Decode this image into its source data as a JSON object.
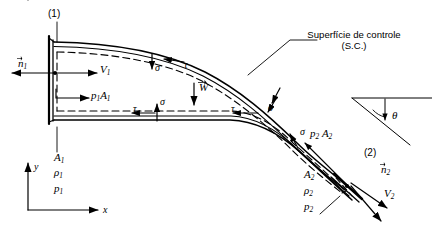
{
  "figure": {
    "kind": "fluid-mechanics-control-volume-diagram",
    "colors": {
      "stroke": "#000000",
      "background": "#ffffff",
      "dashed_control_surface": "#000000"
    }
  },
  "annotations": {
    "control_surface_line1": "Superfície de controle",
    "control_surface_line2": "(S.C.)",
    "section_1": "(1)",
    "section_2": "(2)",
    "normal_1": "n",
    "normal_1_sub": "1",
    "normal_2": "n",
    "normal_2_sub": "2",
    "velocity_1": "V",
    "velocity_1_sub": "1",
    "velocity_2": "V",
    "velocity_2_sub": "2",
    "force_1": "p",
    "force_1_sub": "1",
    "force_1_area": "A",
    "force_1_area_sub": "1",
    "force_2": "p",
    "force_2_sub": "2",
    "force_2_area": "A",
    "force_2_area_sub": "2",
    "weight": "W",
    "theta": "θ",
    "axis_x": "x",
    "axis_y": "y"
  },
  "stresses": {
    "sigma": "σ",
    "tau": "τ",
    "sigma_labels": [
      "σ",
      "σ",
      "σ",
      "σ"
    ],
    "tau_labels": [
      "τ",
      "τ",
      "τ",
      "τ"
    ]
  },
  "inlet_properties": [
    {
      "symbol": "A",
      "sub": "1"
    },
    {
      "symbol": "ρ",
      "sub": "1"
    },
    {
      "symbol": "p",
      "sub": "1"
    }
  ],
  "outlet_properties": [
    {
      "symbol": "A",
      "sub": "2"
    },
    {
      "symbol": "ρ",
      "sub": "2"
    },
    {
      "symbol": "p",
      "sub": "2"
    }
  ]
}
